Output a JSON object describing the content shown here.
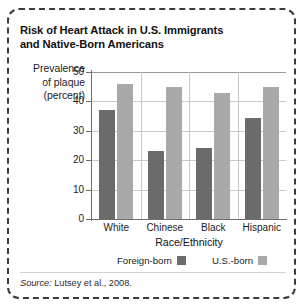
{
  "figure": {
    "title": "Risk of Heart Attack in U.S. Immigrants and Native-Born Americans",
    "title_line1": "Risk of Heart Attack in U.S. Immigrants",
    "title_line2": "and Native-Born Americans",
    "y_caption_line1": "Prevalence",
    "y_caption_line2": "of plaque",
    "y_caption_line3": "(percent)",
    "source_prefix": "Source:",
    "source_text": " Lutsey et al., 2008."
  },
  "colors": {
    "foreign_born": "#6b6b6b",
    "us_born": "#a9a9a9",
    "gridline": "#c9c9c9",
    "axis": "#6e6e6e",
    "border": "#3a3a3a",
    "background": "#ffffff"
  },
  "chart_data": {
    "type": "bar",
    "title": "Risk of Heart Attack in U.S. Immigrants and Native-Born Americans",
    "xlabel": "Race/Ethnicity",
    "ylabel": "Prevalence of plaque (percent)",
    "categories": [
      "White",
      "Chinese",
      "Black",
      "Hispanic"
    ],
    "series": [
      {
        "name": "Foreign-born",
        "color": "#6b6b6b",
        "values": [
          37,
          23,
          24,
          34.5
        ]
      },
      {
        "name": "U.S.-born",
        "color": "#a9a9a9",
        "values": [
          46,
          45,
          43,
          45
        ]
      }
    ],
    "ylim": [
      0,
      50
    ],
    "yticks": [
      0,
      10,
      20,
      30,
      40,
      50
    ],
    "ytick_labels": [
      "0",
      "10",
      "20",
      "30",
      "40",
      "50"
    ],
    "grid": "horizontal-and-vertical",
    "legend_position": "bottom-center",
    "legend": [
      "Foreign-born",
      "U.S.-born"
    ],
    "source": "Source: Lutsey et al., 2008."
  }
}
